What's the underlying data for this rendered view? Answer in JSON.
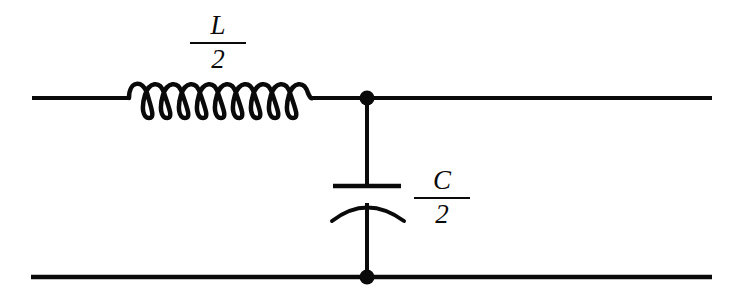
{
  "figure": {
    "type": "electrical-circuit-schematic",
    "background_color": "#ffffff",
    "line_color": "#0a0a0a"
  },
  "labels": {
    "inductor": {
      "name": "L-over-2",
      "numerator": "L",
      "denominator": "2",
      "text": "L/2",
      "x": 218,
      "y": 37
    },
    "capacitor": {
      "name": "C-over-2",
      "numerator": "C",
      "denominator": "2",
      "text": "C/2",
      "x": 442,
      "y": 196
    }
  },
  "components": {
    "inductor": {
      "symbol": "coil",
      "loops": 10,
      "x_start": 128,
      "x_end": 312,
      "baseline_y": 98
    },
    "capacitor": {
      "symbol": "curved-plate-capacitor",
      "plate_y": 186,
      "arc_y": 204,
      "x_center": 367
    },
    "nodes": [
      {
        "name": "top-junction",
        "x": 367,
        "y": 98,
        "radius": 7
      },
      {
        "name": "bottom-junction",
        "x": 367,
        "y": 277,
        "radius": 7
      }
    ],
    "wires": [
      {
        "name": "top-conductor",
        "x1": 32,
        "y1": 98,
        "x2": 712,
        "y2": 98
      },
      {
        "name": "bottom-conductor",
        "x1": 31,
        "y1": 277,
        "x2": 712,
        "y2": 277
      },
      {
        "name": "shunt-branch",
        "x1": 367,
        "y1": 98,
        "x2": 367,
        "y2": 277
      }
    ]
  }
}
